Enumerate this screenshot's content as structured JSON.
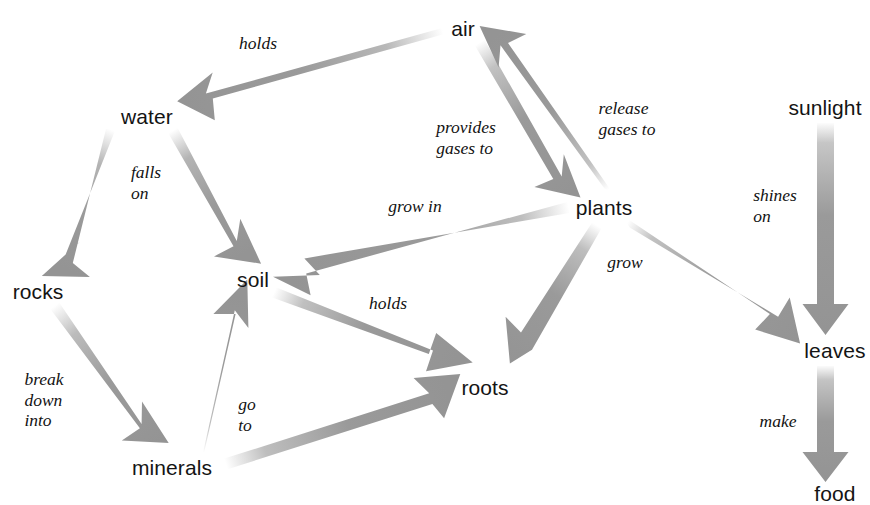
{
  "diagram": {
    "type": "concept-map",
    "canvas": {
      "width": 870,
      "height": 505
    },
    "style": {
      "background": "#ffffff",
      "arrow_color": "#9a9a9a",
      "arrow_color_light": "#cfcfcf",
      "node_text_color": "#141414",
      "edge_label_color": "#121212"
    },
    "nodes": [
      {
        "id": "air",
        "label": "air",
        "x": 463,
        "y": 28
      },
      {
        "id": "water",
        "label": "water",
        "x": 147,
        "y": 116
      },
      {
        "id": "sunlight",
        "label": "sunlight",
        "x": 825,
        "y": 107
      },
      {
        "id": "plants",
        "label": "plants",
        "x": 604,
        "y": 207
      },
      {
        "id": "soil",
        "label": "soil",
        "x": 253,
        "y": 279
      },
      {
        "id": "rocks",
        "label": "rocks",
        "x": 38,
        "y": 291
      },
      {
        "id": "leaves",
        "label": "leaves",
        "x": 835,
        "y": 350
      },
      {
        "id": "roots",
        "label": "roots",
        "x": 485,
        "y": 387
      },
      {
        "id": "minerals",
        "label": "minerals",
        "x": 172,
        "y": 467
      },
      {
        "id": "food",
        "label": "food",
        "x": 835,
        "y": 493
      }
    ],
    "edges": [
      {
        "id": "air-water",
        "from": "air",
        "to": "water",
        "label": "holds",
        "label_x": 258,
        "label_y": 43,
        "align": "center"
      },
      {
        "id": "water-rocks",
        "from": "water",
        "to": "rocks",
        "label": "",
        "label_x": 0,
        "label_y": 0,
        "align": "center"
      },
      {
        "id": "water-soil",
        "from": "water",
        "to": "soil",
        "label": "falls\non",
        "label_x": 146,
        "label_y": 183,
        "align": "left"
      },
      {
        "id": "rocks-minerals",
        "from": "rocks",
        "to": "minerals",
        "label": "break\ndown\ninto",
        "label_x": 44,
        "label_y": 400,
        "align": "left"
      },
      {
        "id": "minerals-soil",
        "from": "minerals",
        "to": "soil",
        "label": "go\nto",
        "label_x": 247,
        "label_y": 415,
        "align": "left"
      },
      {
        "id": "air-plants",
        "from": "air",
        "to": "plants",
        "label": "provides\ngases to",
        "label_x": 466,
        "label_y": 138,
        "align": "left"
      },
      {
        "id": "plants-air",
        "from": "plants",
        "to": "air",
        "label": "release\ngases to",
        "label_x": 627,
        "label_y": 119,
        "align": "left"
      },
      {
        "id": "plants-soil",
        "from": "plants",
        "to": "soil",
        "label": "grow in",
        "label_x": 415,
        "label_y": 206,
        "align": "center"
      },
      {
        "id": "soil-roots",
        "from": "soil",
        "to": "roots",
        "label": "holds",
        "label_x": 388,
        "label_y": 303,
        "align": "center"
      },
      {
        "id": "plants-roots",
        "from": "plants",
        "to": "roots",
        "label": "grow",
        "label_x": 625,
        "label_y": 262,
        "align": "center"
      },
      {
        "id": "minerals-roots",
        "from": "minerals",
        "to": "roots",
        "label": "",
        "label_x": 0,
        "label_y": 0,
        "align": "center"
      },
      {
        "id": "sunlight-leaves",
        "from": "sunlight",
        "to": "leaves",
        "label": "shines\non",
        "label_x": 775,
        "label_y": 206,
        "align": "left"
      },
      {
        "id": "plants-leaves",
        "from": "plants",
        "to": "leaves",
        "label": "",
        "label_x": 0,
        "label_y": 0,
        "align": "center"
      },
      {
        "id": "leaves-food",
        "from": "leaves",
        "to": "food",
        "label": "make",
        "label_x": 778,
        "label_y": 421,
        "align": "center"
      }
    ]
  }
}
